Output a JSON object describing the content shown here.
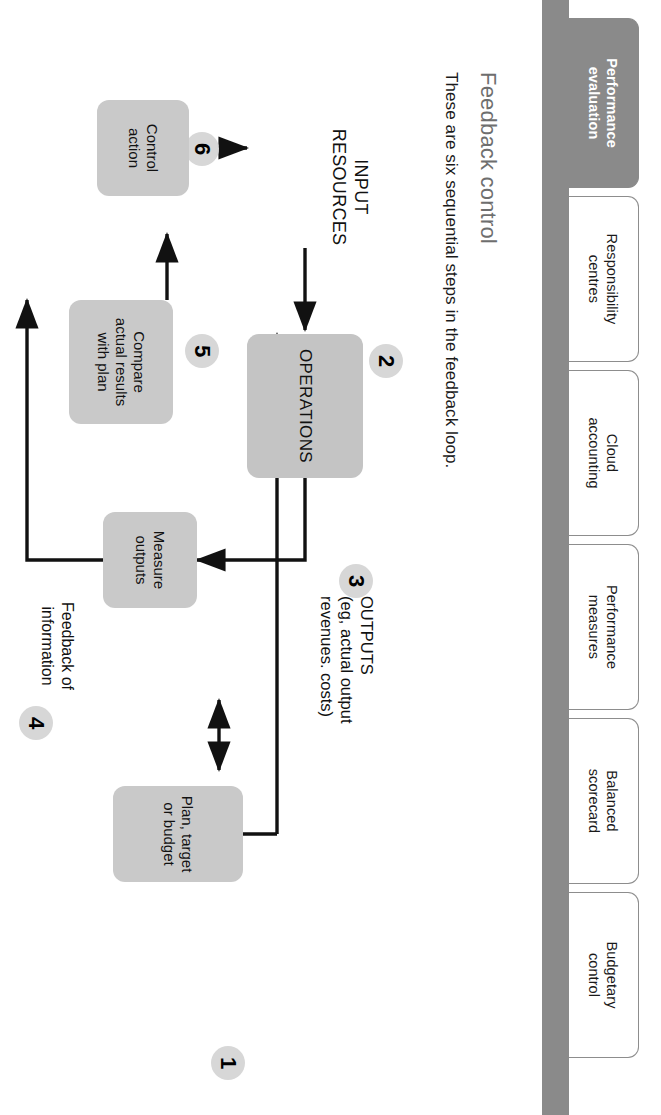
{
  "tabs": [
    {
      "id": "performance-evaluation",
      "line1": "Performance",
      "line2": "evaluation",
      "active": true
    },
    {
      "id": "responsibility-centres",
      "line1": "Responsibility",
      "line2": "centres",
      "active": false
    },
    {
      "id": "cloud-accounting",
      "line1": "Cloud",
      "line2": "accounting",
      "active": false
    },
    {
      "id": "performance-measures",
      "line1": "Performance",
      "line2": "measures",
      "active": false
    },
    {
      "id": "balanced-scorecard",
      "line1": "Balanced",
      "line2": "scorecard",
      "active": false
    },
    {
      "id": "budgetary-control",
      "line1": "Budgetary",
      "line2": "control",
      "active": false
    }
  ],
  "header": {
    "title": "Feedback control",
    "subtitle": "These are six sequential steps in the feedback loop."
  },
  "diagram": {
    "type": "flowchart",
    "nodes": [
      {
        "id": "plan",
        "label_lines": [
          "Plan, target",
          "or budget"
        ],
        "step": "1",
        "shape": "rounded-box",
        "fill": "#c9c9c9"
      },
      {
        "id": "operations",
        "label_lines": [
          "OPERATIONS"
        ],
        "step": "2",
        "shape": "rounded-box",
        "fill": "#c4c4c4"
      },
      {
        "id": "outputs",
        "label_lines": [
          "OUTPUTS",
          "(eg, actual output",
          "revenues. costs)"
        ],
        "step": "3",
        "shape": "text"
      },
      {
        "id": "feedback",
        "label_lines": [
          "Feedback of",
          "information"
        ],
        "step": "4",
        "shape": "text"
      },
      {
        "id": "compare",
        "label_lines": [
          "Compare",
          "actual results",
          "with plan"
        ],
        "step": "5",
        "shape": "rounded-box",
        "fill": "#c9c9c9"
      },
      {
        "id": "control",
        "label_lines": [
          "Control",
          "action"
        ],
        "step": "6",
        "shape": "rounded-box",
        "fill": "#c9c9c9"
      },
      {
        "id": "measure",
        "label_lines": [
          "Measure",
          "outputs"
        ],
        "step": "",
        "shape": "rounded-box",
        "fill": "#c9c9c9"
      },
      {
        "id": "input",
        "label_lines": [
          "INPUT",
          "RESOURCES"
        ],
        "step": "",
        "shape": "text"
      }
    ],
    "edges": [
      {
        "from": "input",
        "to": "operations",
        "style": "arrow"
      },
      {
        "from": "operations",
        "to": "outputs",
        "style": "elbow-arrow"
      },
      {
        "from": "measure",
        "to": "compare",
        "style": "elbow-arrow"
      },
      {
        "from": "compare",
        "to": "control",
        "style": "arrow"
      },
      {
        "from": "control",
        "to": "operations",
        "style": "arrow"
      },
      {
        "from": "plan",
        "to": "operations",
        "style": "arrow"
      },
      {
        "from": "plan",
        "to": "compare",
        "style": "double-arrow"
      }
    ],
    "colors": {
      "node_fill": "#c9c9c9",
      "bar": "#8a8a8a",
      "line": "#111111",
      "title": "#6e6e6e"
    }
  },
  "labels": {
    "input_l1": "INPUT",
    "input_l2": "RESOURCES",
    "outputs_l1": "OUTPUTS",
    "outputs_l2": "(eg, actual output",
    "outputs_l3": "revenues. costs)",
    "feedback_l1": "Feedback of",
    "feedback_l2": "information",
    "plan_l1": "Plan, target",
    "plan_l2": "or budget",
    "compare_l1": "Compare",
    "compare_l2": "actual results",
    "compare_l3": "with plan",
    "control_l1": "Control",
    "control_l2": "action",
    "measure_l1": "Measure",
    "measure_l2": "outputs",
    "operations": "OPERATIONS",
    "n1": "1",
    "n2": "2",
    "n3": "3",
    "n4": "4",
    "n5": "5",
    "n6": "6"
  }
}
